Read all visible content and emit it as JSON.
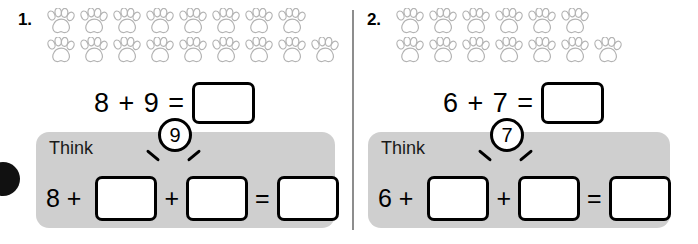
{
  "worksheet": {
    "edge_marker": "page-edge-dot",
    "divider": "vertical-rule"
  },
  "problems": [
    {
      "number": "1.",
      "counter_icon": "paw-print-icon",
      "paw_rows": [
        8,
        9
      ],
      "equation": {
        "text": "8 + 9 =",
        "answer_value": "",
        "addend_a": "8",
        "addend_b": "9"
      },
      "think": {
        "label": "Think",
        "circled_number": "7",
        "lead_text": "8 +",
        "plus": "+",
        "equals": "=",
        "box1_value": "",
        "box2_value": "",
        "box3_value": ""
      }
    },
    {
      "number": "2.",
      "counter_icon": "paw-print-icon",
      "paw_rows": [
        6,
        7
      ],
      "equation": {
        "text": "6 + 7 =",
        "answer_value": "",
        "addend_a": "6",
        "addend_b": "7"
      },
      "think": {
        "label": "Think",
        "circled_number": "7",
        "lead_text": "6 +",
        "plus": "+",
        "equals": "=",
        "box1_value": "",
        "box2_value": "",
        "box3_value": ""
      }
    }
  ],
  "colors": {
    "panel_gray": "#cfcfcf",
    "paw_outline": "#b3b3b3",
    "ink": "#000000",
    "divider": "#8d8d8d"
  }
}
